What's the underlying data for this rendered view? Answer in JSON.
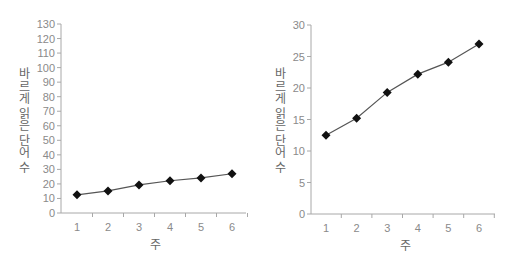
{
  "chart_data": [
    {
      "type": "line",
      "title": "",
      "xlabel": "주",
      "ylabel": "바르게 읽은 단어 수",
      "categories": [
        "1",
        "2",
        "3",
        "4",
        "5",
        "6"
      ],
      "series": [
        {
          "name": "바르게 읽은 단어 수",
          "values": [
            12.5,
            15.2,
            19.3,
            22.2,
            24.1,
            27.0
          ],
          "marker": "diamond"
        }
      ],
      "ylim": [
        0,
        130
      ],
      "yticks": [
        0,
        10,
        20,
        30,
        40,
        50,
        60,
        70,
        80,
        90,
        100,
        110,
        120,
        130
      ],
      "grid": false,
      "legend": "none"
    },
    {
      "type": "line",
      "title": "",
      "xlabel": "주",
      "ylabel": "바르게 읽은 단어 수",
      "categories": [
        "1",
        "2",
        "3",
        "4",
        "5",
        "6"
      ],
      "series": [
        {
          "name": "바르게 읽은 단어 수",
          "values": [
            12.5,
            15.2,
            19.3,
            22.2,
            24.1,
            27.0
          ],
          "marker": "diamond"
        }
      ],
      "ylim": [
        0,
        30
      ],
      "yticks": [
        0,
        5,
        10,
        15,
        20,
        25,
        30
      ],
      "grid": false,
      "legend": "none"
    }
  ]
}
